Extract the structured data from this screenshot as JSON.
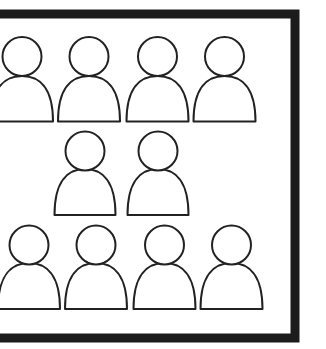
{
  "diagram": {
    "colors": {
      "background": "#ffffff",
      "frame": "#1c1c1c",
      "outline": "#222222",
      "fill": "#ffffff"
    },
    "frame": {
      "x": -10,
      "y": 14,
      "width": 305,
      "height": 324,
      "stroke_width": 9
    },
    "icon": "person-icon",
    "rows": [
      {
        "name": "top-row",
        "count": 4,
        "head_cy": 56.5,
        "head_r": 19.5,
        "body_top": 76,
        "body_base": 121.5,
        "body_half_width": 31,
        "centers": [
          22,
          89,
          157.5,
          224.5
        ]
      },
      {
        "name": "middle-row",
        "count": 2,
        "head_cy": 151,
        "head_r": 19.5,
        "body_top": 169,
        "body_base": 215,
        "body_half_width": 30.5,
        "centers": [
          85,
          158
        ]
      },
      {
        "name": "bottom-row",
        "count": 4,
        "head_cy": 245,
        "head_r": 19.5,
        "body_top": 263,
        "body_base": 309,
        "body_half_width": 31,
        "centers": [
          29,
          96,
          164.5,
          231.5
        ]
      }
    ],
    "total_people": 10
  }
}
